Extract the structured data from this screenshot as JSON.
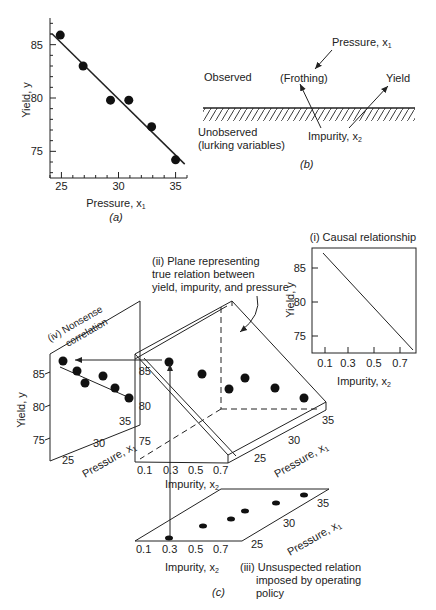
{
  "chart_data": [
    {
      "id": "a",
      "type": "scatter",
      "caption": "(a)",
      "xlabel": "Pressure, x1",
      "ylabel": "Yield, y",
      "xticks": [
        "25",
        "30",
        "35"
      ],
      "yticks": [
        "75",
        "80",
        "85"
      ],
      "xlim": [
        24,
        36
      ],
      "ylim": [
        72.5,
        87.5
      ],
      "points": [
        [
          24.9,
          85.9
        ],
        [
          26.9,
          83.0
        ],
        [
          29.3,
          79.8
        ],
        [
          30.9,
          79.8
        ],
        [
          32.9,
          77.3
        ],
        [
          35.0,
          74.2
        ]
      ],
      "fit_line": [
        [
          24.2,
          86.0
        ],
        [
          35.8,
          73.8
        ]
      ]
    },
    {
      "id": "c-i",
      "type": "line",
      "title": "(i) Causal relationship",
      "xlabel": "Impurity, x2",
      "ylabel": "Yield, y",
      "xticks": [
        "0.1",
        "0.3",
        "0.5",
        "0.7"
      ],
      "yticks": [
        "75",
        "80",
        "85"
      ],
      "xlim": [
        0.0,
        0.8
      ],
      "ylim": [
        72,
        88
      ],
      "line": [
        [
          0.1,
          86.8
        ],
        [
          0.78,
          73.1
        ]
      ]
    }
  ],
  "panel_b": {
    "observed": "Observed",
    "unobserved_1": "Unobserved",
    "unobserved_2": "(lurking variables)",
    "pressure": "Pressure, x",
    "pressure_sub": "1",
    "frothing": "(Frothing)",
    "yield": "Yield",
    "impurity": "Impurity, x",
    "impurity_sub": "2",
    "caption": "(b)"
  },
  "panel_c": {
    "caption": "(c)",
    "plane_label_1": "(ii) Plane representing",
    "plane_label_2": "true relation between",
    "plane_label_3": "yield, impurity, and pressure",
    "nonsense_1": "(iv) Nonsense",
    "nonsense_2": "correlation",
    "policy_1": "(iii) Unsuspected relation",
    "policy_2": "imposed by operating",
    "policy_3": "policy",
    "yield_label": "Yield, y",
    "pressure_label": "Pressure, x",
    "impurity_label": "Impurity, x",
    "sub1": "1",
    "sub2": "2",
    "yticks": [
      "75",
      "80",
      "85"
    ],
    "pticks": [
      "25",
      "30",
      "35"
    ],
    "iticks": [
      "0.1",
      "0.3",
      "0.5",
      "0.7"
    ]
  }
}
